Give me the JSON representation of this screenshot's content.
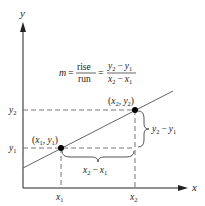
{
  "diagram": {
    "type": "slope-of-line",
    "axes": {
      "x_label": "x",
      "y_label": "y"
    },
    "formula": {
      "lhs": "m",
      "eq1": "=",
      "frac1_num": "rise",
      "frac1_den": "run",
      "eq2": "=",
      "frac2_num_a": "y",
      "frac2_num_a_sub": "2",
      "frac2_num_op": "−",
      "frac2_num_b": "y",
      "frac2_num_b_sub": "1",
      "frac2_den_a": "x",
      "frac2_den_a_sub": "2",
      "frac2_den_op": "−",
      "frac2_den_b": "x",
      "frac2_den_b_sub": "1"
    },
    "points": [
      {
        "label": "(x1, y1)",
        "x": "x",
        "x_sub": "1",
        "y": "y",
        "y_sub": "1"
      },
      {
        "label": "(x2, y2)",
        "x": "x",
        "x_sub": "2",
        "y": "y",
        "y_sub": "2"
      }
    ],
    "tick_labels": {
      "x1": "x",
      "x1_sub": "1",
      "x2": "x",
      "x2_sub": "2",
      "y1": "y",
      "y1_sub": "1",
      "y2": "y",
      "y2_sub": "2"
    },
    "run_label": {
      "a": "x",
      "a_sub": "2",
      "op": "−",
      "b": "x",
      "b_sub": "1"
    },
    "rise_label": {
      "a": "y",
      "a_sub": "2",
      "op": "−",
      "b": "y",
      "b_sub": "1"
    },
    "colors": {
      "axis": "#222222",
      "line": "#555555",
      "dashed": "#555555",
      "point": "#000000"
    }
  }
}
